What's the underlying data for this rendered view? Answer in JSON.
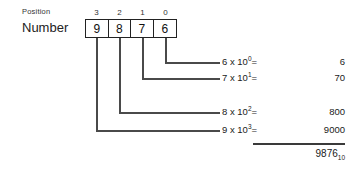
{
  "labels": {
    "position": "Position",
    "number": "Number"
  },
  "positions": [
    "3",
    "2",
    "1",
    "0"
  ],
  "digits": [
    "9",
    "8",
    "7",
    "6"
  ],
  "equations": [
    {
      "digit": "6",
      "times": "x",
      "base": "10",
      "exponent": "0",
      "equals": "=",
      "value": "6"
    },
    {
      "digit": "7",
      "times": "x",
      "base": "10",
      "exponent": "1",
      "equals": "=",
      "value": "70"
    },
    {
      "digit": "8",
      "times": "x",
      "base": "10",
      "exponent": "2",
      "equals": "=",
      "value": "800"
    },
    {
      "digit": "9",
      "times": "x",
      "base": "10",
      "exponent": "3",
      "equals": "=",
      "value": "9000"
    }
  ],
  "total": {
    "value": "9876",
    "subscript": "10"
  },
  "colors": {
    "background": "#ffffff",
    "ink": "#1a1a1a",
    "box_border": "#222222",
    "connector": "#4a4a4a",
    "rule": "#3a3a3a"
  }
}
